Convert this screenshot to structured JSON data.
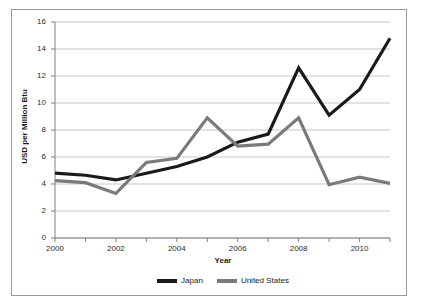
{
  "chart_data": {
    "type": "line",
    "title": "",
    "xlabel": "Year",
    "ylabel": "USD per Million Btu",
    "x": [
      2000,
      2001,
      2002,
      2003,
      2004,
      2005,
      2006,
      2007,
      2008,
      2009,
      2010,
      2011
    ],
    "categories": [
      "2000",
      "2001",
      "2002",
      "2003",
      "2004",
      "2005",
      "2006",
      "2007",
      "2008",
      "2009",
      "2010",
      "2011"
    ],
    "series": [
      {
        "name": "Japan",
        "color": "#1a1a1a",
        "values": [
          4.8,
          4.65,
          4.3,
          4.8,
          5.3,
          6.0,
          7.1,
          7.7,
          12.6,
          9.1,
          11.0,
          14.8
        ]
      },
      {
        "name": "United States",
        "color": "#7a7a7a",
        "values": [
          4.25,
          4.1,
          3.3,
          5.6,
          5.9,
          8.9,
          6.8,
          6.95,
          8.9,
          3.95,
          4.5,
          4.05
        ]
      }
    ],
    "xlim": [
      2000,
      2011
    ],
    "ylim": [
      0,
      16
    ],
    "yticks": [
      0,
      2,
      4,
      6,
      8,
      10,
      12,
      14,
      16
    ],
    "ytick_labels": [
      "0",
      "2",
      "4",
      "6",
      "8",
      "10",
      "12",
      "14",
      "16"
    ],
    "xticks": [
      2000,
      2002,
      2004,
      2006,
      2008,
      2010
    ],
    "xtick_labels": [
      "2000",
      "2002",
      "2004",
      "2006",
      "2008",
      "2010"
    ],
    "grid": "horizontal",
    "legend_position": "bottom",
    "gridline_color": "#c8c8c8",
    "axis_color": "#808080",
    "background_color": "#ffffff",
    "frame_color": "#9a9a9a"
  },
  "legend": {
    "items": [
      {
        "label": "Japan",
        "color": "#1a1a1a"
      },
      {
        "label": "United States",
        "color": "#7a7a7a"
      }
    ]
  }
}
